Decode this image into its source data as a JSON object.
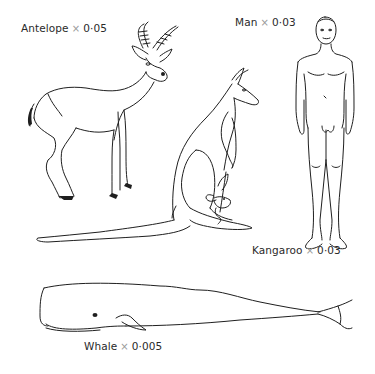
{
  "figure": {
    "items": [
      {
        "id": "antelope",
        "name": "Antelope",
        "symbol": "×",
        "scale": "0·05"
      },
      {
        "id": "man",
        "name": "Man",
        "symbol": "×",
        "scale": "0·03"
      },
      {
        "id": "kangaroo",
        "name": "Kangaroo",
        "symbol": "×",
        "scale": "0·03"
      },
      {
        "id": "whale",
        "name": "Whale",
        "symbol": "×",
        "scale": "0·005"
      }
    ]
  },
  "colors": {
    "line": "#1f1f1f",
    "text": "#2a2a2a",
    "times": "#9a9a9a",
    "background": "#ffffff"
  }
}
